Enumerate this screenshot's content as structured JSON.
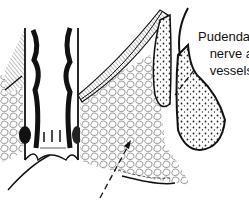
{
  "figure": {
    "style": "black and white line drawing",
    "colors": {
      "ink": "#111111",
      "background": "#ffffff",
      "fat_fill": "#f4f4f4"
    }
  },
  "labels": [
    {
      "id": "pudendal",
      "lines": [
        "Pudendal",
        "nerve a",
        "vessels"
      ]
    }
  ],
  "pointers": [
    {
      "name": "pudendal-leader-line",
      "style": "dashed"
    },
    {
      "name": "fossa-arrow",
      "style": "dashed-arrow"
    }
  ]
}
